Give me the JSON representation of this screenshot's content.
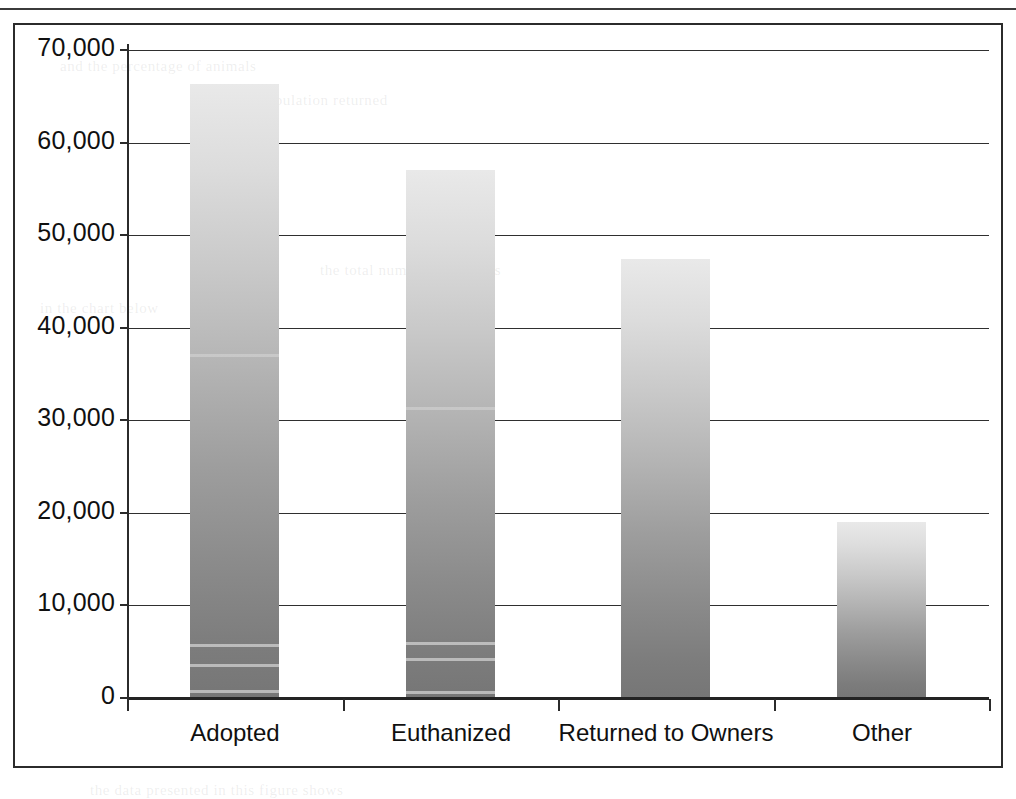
{
  "figure": {
    "frame_border_color": "#2b2b2b",
    "background": "#ffffff"
  },
  "chart_data": {
    "type": "bar",
    "title": "",
    "subtitle": "",
    "xlabel": "",
    "ylabel": "",
    "categories": [
      "Adopted",
      "Euthanized",
      "Returned to Owners",
      "Other"
    ],
    "values": [
      66300,
      57000,
      47400,
      19000
    ],
    "ylim": [
      0,
      70000
    ],
    "ytick_values": [
      0,
      10000,
      20000,
      30000,
      40000,
      50000,
      60000,
      70000
    ],
    "ytick_labels": [
      "0",
      "10,000",
      "20,000",
      "30,000",
      "40,000",
      "50,000",
      "60,000",
      "70,000"
    ],
    "grid": true,
    "grid_axis": "y",
    "legend": false,
    "legend_position": "none",
    "bar_fill": "gradient-light-gray-to-dark-gray",
    "bar_color_top": "#e9e9e9",
    "bar_color_bottom": "#767676",
    "annotations": []
  },
  "ghost_text": {
    "line1": "and the percentage of animals",
    "line2": "shelter population returned",
    "line3": "the total number of animals",
    "line4": "in the chart below",
    "line5": "the data presented in this figure shows"
  }
}
